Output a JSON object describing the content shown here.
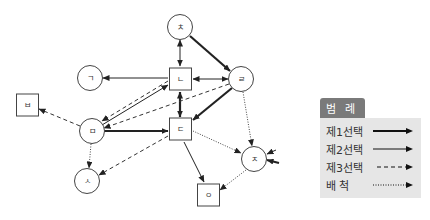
{
  "diagram": {
    "nodes": [
      {
        "id": "chieut",
        "label": "ㅊ",
        "shape": "circle",
        "x": 180,
        "y": 27
      },
      {
        "id": "giyeok",
        "label": "ㄱ",
        "shape": "circle",
        "x": 90,
        "y": 78
      },
      {
        "id": "nieun",
        "label": "ㄴ",
        "shape": "square",
        "x": 180,
        "y": 79
      },
      {
        "id": "rieul",
        "label": "ㄹ",
        "shape": "circle",
        "x": 241,
        "y": 79
      },
      {
        "id": "bieup",
        "label": "ㅂ",
        "shape": "square",
        "x": 27,
        "y": 105
      },
      {
        "id": "mieum",
        "label": "ㅁ",
        "shape": "circle",
        "x": 92,
        "y": 131
      },
      {
        "id": "digeut",
        "label": "ㄷ",
        "shape": "square",
        "x": 180,
        "y": 129
      },
      {
        "id": "jieut",
        "label": "ㅈ",
        "shape": "circle",
        "x": 254,
        "y": 159
      },
      {
        "id": "siot",
        "label": "ㅅ",
        "shape": "circle",
        "x": 87,
        "y": 181
      },
      {
        "id": "ieung",
        "label": "ㅇ",
        "shape": "square",
        "x": 208,
        "y": 195
      }
    ],
    "edges": [
      {
        "from": "chieut",
        "to": "rieul",
        "type": "first"
      },
      {
        "from": "rieul",
        "to": "digeut",
        "type": "first"
      },
      {
        "from": "mieum",
        "to": "digeut",
        "type": "first"
      },
      {
        "from": "digeut",
        "to": "nieun",
        "type": "first",
        "bidirectional": true
      },
      {
        "from": "chieut",
        "to": "nieun",
        "type": "second",
        "bidirectional": true
      },
      {
        "from": "nieun",
        "to": "rieul",
        "type": "second",
        "bidirectional": true
      },
      {
        "from": "nieun",
        "to": "giyeok",
        "type": "second"
      },
      {
        "from": "mieum",
        "to": "nieun",
        "type": "second"
      },
      {
        "from": "digeut",
        "to": "ieung",
        "type": "second"
      },
      {
        "from": "nieun",
        "to": "mieum",
        "type": "third"
      },
      {
        "from": "rieul",
        "to": "mieum",
        "type": "third"
      },
      {
        "from": "mieum",
        "to": "bieup",
        "type": "third"
      },
      {
        "from": "digeut",
        "to": "siot",
        "type": "third"
      },
      {
        "from": "mieum",
        "to": "siot",
        "type": "reject"
      },
      {
        "from": "rieul",
        "to": "jieut",
        "type": "reject"
      },
      {
        "from": "digeut",
        "to": "jieut",
        "type": "reject"
      },
      {
        "from": "jieut",
        "to": "ieung",
        "type": "reject"
      },
      {
        "from": "external-right-1",
        "to": "jieut",
        "type": "second"
      },
      {
        "from": "external-right-2",
        "to": "jieut",
        "type": "first"
      }
    ]
  },
  "legend": {
    "title": "범 례",
    "items": [
      {
        "label": "제1선택",
        "type": "first"
      },
      {
        "label": "제2선택",
        "type": "second"
      },
      {
        "label": "제3선택",
        "type": "third"
      },
      {
        "label": "배 척",
        "type": "reject"
      }
    ]
  }
}
